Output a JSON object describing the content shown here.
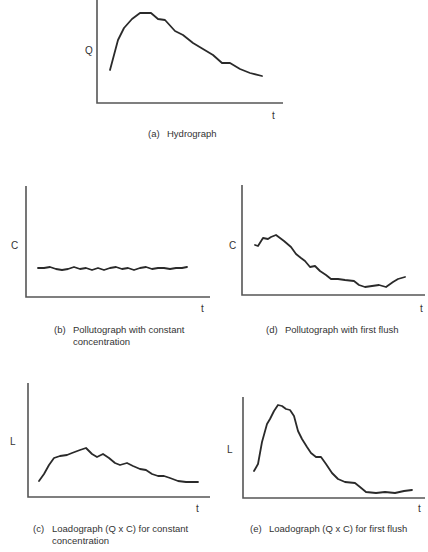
{
  "chart_data": [
    {
      "id": "a",
      "type": "line",
      "title": "(a)  Hydrograph",
      "xlabel": "t",
      "ylabel": "Q",
      "grid": false,
      "legend": null,
      "axes_px": {
        "x0": 97,
        "y0": 103,
        "x1": 283,
        "ytop": 0
      },
      "points": [
        [
          110,
          70
        ],
        [
          114,
          55
        ],
        [
          118,
          40
        ],
        [
          124,
          28
        ],
        [
          132,
          19
        ],
        [
          140,
          13
        ],
        [
          151,
          13
        ],
        [
          158,
          19
        ],
        [
          165,
          20
        ],
        [
          175,
          31
        ],
        [
          183,
          35
        ],
        [
          193,
          43
        ],
        [
          203,
          49
        ],
        [
          213,
          55
        ],
        [
          222,
          63
        ],
        [
          230,
          63
        ],
        [
          240,
          69
        ],
        [
          250,
          73
        ],
        [
          262,
          76
        ]
      ]
    },
    {
      "id": "b",
      "type": "line",
      "title": "(b)  Pollutograph with constant concentration",
      "xlabel": "t",
      "ylabel": "C",
      "grid": false,
      "legend": null,
      "axes_px": {
        "x0": 26,
        "y0": 297,
        "x1": 210,
        "ytop": 186
      },
      "points": [
        [
          38,
          268
        ],
        [
          44,
          268
        ],
        [
          50,
          267
        ],
        [
          56,
          269
        ],
        [
          62,
          270
        ],
        [
          68,
          269
        ],
        [
          74,
          267
        ],
        [
          80,
          269
        ],
        [
          86,
          268
        ],
        [
          92,
          270
        ],
        [
          98,
          268
        ],
        [
          104,
          270
        ],
        [
          110,
          268
        ],
        [
          116,
          267
        ],
        [
          122,
          269
        ],
        [
          128,
          268
        ],
        [
          134,
          270
        ],
        [
          140,
          268
        ],
        [
          146,
          267
        ],
        [
          152,
          269
        ],
        [
          158,
          268
        ],
        [
          164,
          268
        ],
        [
          170,
          269
        ],
        [
          176,
          268
        ],
        [
          182,
          268
        ],
        [
          187,
          267
        ]
      ]
    },
    {
      "id": "d",
      "type": "line",
      "title": "(d)  Pollutograph with first flush",
      "xlabel": "t",
      "ylabel": "C",
      "grid": false,
      "legend": null,
      "axes_px": {
        "x0": 242,
        "y0": 295,
        "x1": 425,
        "ytop": 185
      },
      "points": [
        [
          255,
          245
        ],
        [
          258,
          246
        ],
        [
          263,
          238
        ],
        [
          268,
          239
        ],
        [
          271,
          237
        ],
        [
          276,
          235
        ],
        [
          284,
          241
        ],
        [
          291,
          247
        ],
        [
          296,
          254
        ],
        [
          301,
          258
        ],
        [
          305,
          261
        ],
        [
          310,
          267
        ],
        [
          315,
          266
        ],
        [
          320,
          271
        ],
        [
          326,
          275
        ],
        [
          331,
          279
        ],
        [
          338,
          279
        ],
        [
          345,
          280
        ],
        [
          354,
          281
        ],
        [
          359,
          285
        ],
        [
          365,
          287
        ],
        [
          372,
          286
        ],
        [
          379,
          285
        ],
        [
          386,
          287
        ],
        [
          393,
          282
        ],
        [
          398,
          279
        ],
        [
          405,
          277
        ]
      ]
    },
    {
      "id": "c",
      "type": "line",
      "title": "(c)  Loadograph (Q x C) for constant concentration",
      "xlabel": "t",
      "ylabel": "L",
      "grid": false,
      "legend": null,
      "axes_px": {
        "x0": 28,
        "y0": 497,
        "x1": 210,
        "ytop": 383
      },
      "points": [
        [
          39,
          481
        ],
        [
          44,
          474
        ],
        [
          49,
          465
        ],
        [
          54,
          458
        ],
        [
          60,
          456
        ],
        [
          67,
          455
        ],
        [
          72,
          453
        ],
        [
          80,
          450
        ],
        [
          86,
          448
        ],
        [
          92,
          454
        ],
        [
          97,
          457
        ],
        [
          103,
          454
        ],
        [
          109,
          458
        ],
        [
          115,
          463
        ],
        [
          120,
          465
        ],
        [
          127,
          463
        ],
        [
          133,
          466
        ],
        [
          140,
          469
        ],
        [
          146,
          470
        ],
        [
          152,
          474
        ],
        [
          158,
          476
        ],
        [
          164,
          476
        ],
        [
          170,
          478
        ],
        [
          178,
          481
        ],
        [
          186,
          482
        ],
        [
          198,
          482
        ]
      ]
    },
    {
      "id": "e",
      "type": "line",
      "title": "(e)  Loadograph (Q x C) for first flush",
      "xlabel": "t",
      "ylabel": "L",
      "grid": false,
      "legend": null,
      "axes_px": {
        "x0": 243,
        "y0": 498,
        "x1": 425,
        "ytop": 397
      },
      "points": [
        [
          254,
          471
        ],
        [
          258,
          464
        ],
        [
          262,
          442
        ],
        [
          267,
          424
        ],
        [
          270,
          419
        ],
        [
          274,
          411
        ],
        [
          278,
          405
        ],
        [
          282,
          406
        ],
        [
          286,
          409
        ],
        [
          290,
          410
        ],
        [
          294,
          416
        ],
        [
          298,
          431
        ],
        [
          302,
          439
        ],
        [
          307,
          447
        ],
        [
          311,
          453
        ],
        [
          316,
          457
        ],
        [
          321,
          457
        ],
        [
          326,
          464
        ],
        [
          332,
          473
        ],
        [
          338,
          479
        ],
        [
          345,
          482
        ],
        [
          355,
          483
        ],
        [
          360,
          487
        ],
        [
          366,
          492
        ],
        [
          376,
          493
        ],
        [
          385,
          492
        ],
        [
          395,
          493
        ],
        [
          404,
          491
        ],
        [
          412,
          490
        ]
      ]
    }
  ],
  "labels": {
    "a": {
      "y": "Q",
      "x": "t",
      "tag": "(a)",
      "caption1": "Hydrograph",
      "caption2": ""
    },
    "b": {
      "y": "C",
      "x": "t",
      "tag": "(b)",
      "caption1": "Pollutograph with constant",
      "caption2": "concentration"
    },
    "d": {
      "y": "C",
      "x": "t",
      "tag": "(d)",
      "caption1": "Pollutograph with first flush",
      "caption2": ""
    },
    "c": {
      "y": "L",
      "x": "t",
      "tag": "(c)",
      "caption1": "Loadograph (Q x C) for constant",
      "caption2": "concentration"
    },
    "e": {
      "y": "L",
      "x": "t",
      "tag": "(e)",
      "caption1": "Loadograph (Q x C) for first flush",
      "caption2": ""
    }
  }
}
